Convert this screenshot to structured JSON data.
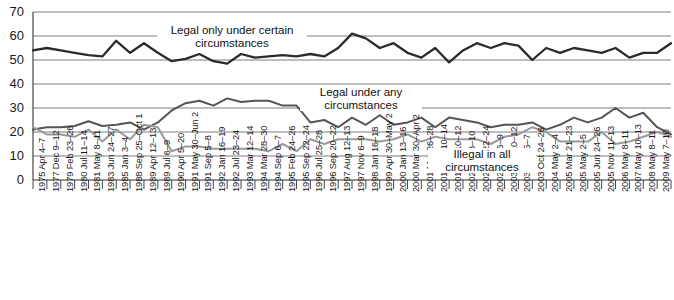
{
  "chart_data": {
    "type": "line",
    "title": "",
    "xlabel": "",
    "ylabel": "",
    "ylim": [
      0,
      70
    ],
    "ytick_step": 10,
    "grid": true,
    "legend_position": "inline-annotations",
    "yticks": [
      0,
      10,
      20,
      30,
      40,
      50,
      60,
      70
    ],
    "categories": [
      "1975 Apr 4–7",
      "1977 Dec 9–12",
      "1979 Feb 23–26",
      "1980 Jul 11–14",
      "1981 May 8–11",
      "1983 Jun 24–27",
      "1985 Jan 3–4",
      "1988 Sep 25–Oct 1",
      "1989 Apr 12–13",
      "1989 Jul 6–9",
      "1990 Apr 5–20",
      "1991 May 30–Jun 2",
      "1991 Sep 5–8",
      "1992 Jan 16–19",
      "1992 Jul 23–24",
      "1993 Mar 12–14",
      "1994 Mar 28–30",
      "1994 Sep 6–7",
      "1995 Feb 24–26",
      "1995 Sep 22–24",
      "1996 Jul 25–28",
      "1996 Sep 20–22",
      "1997 Aug 12–13",
      "1997 Nov 6–9",
      "1998 Jan 16–18",
      "1999 Apr 30–May 2",
      "2000 Jan 13–16",
      "2000 Mar 30–Apr 2",
      "2001 Mar 26–28",
      "2001 May 10–14",
      "2001 Aug 10–12",
      "2002 Feb 8–10",
      "2002 Mar 22–24",
      "2002 May 6–9",
      "2003 Jan 10–12",
      "2003 May 5–7",
      "2003 Oct 24–26",
      "2004 May 2–4",
      "2005 Mar 21–23",
      "2005 May 2–5",
      "2005 Jun 24–26",
      "2005 Nov 11–13",
      "2006 May 8–11",
      "2007 May 10–13",
      "2008 May 8–11",
      "2009 May 7–10",
      "2009 Jul 17–19"
    ],
    "series": [
      {
        "name": "Legal only under certain circumstances",
        "color": "#2b2b2b",
        "values": [
          54,
          55,
          54,
          53,
          52,
          51.5,
          58,
          53,
          57,
          53,
          49.5,
          50.5,
          52.5,
          49.5,
          48.5,
          52.5,
          51,
          51.5,
          52,
          51.5,
          52.5,
          51.5,
          55,
          61,
          59,
          55,
          57,
          53,
          51,
          55,
          49,
          54,
          57,
          55,
          57,
          56,
          50,
          55,
          53,
          55,
          54,
          53,
          55,
          51,
          53,
          53,
          57
        ]
      },
      {
        "name": "Legal under any circumstances",
        "color": "#555555",
        "values": [
          21,
          22,
          22,
          22.5,
          24.5,
          22.5,
          23,
          24,
          21,
          24,
          29,
          32,
          33,
          31,
          34,
          32.5,
          33,
          33,
          31,
          31,
          24,
          25,
          22,
          26,
          23,
          27,
          23,
          24,
          26,
          22,
          26,
          25,
          24,
          22,
          23,
          23,
          24,
          21,
          23,
          26,
          24,
          26,
          30,
          26,
          28,
          22,
          19
        ]
      },
      {
        "name": "Illegal in all circumstances",
        "color": "#9a9a9a",
        "values": [
          22,
          19,
          19,
          18,
          21,
          16,
          21,
          17,
          23,
          22,
          12,
          14,
          14,
          13,
          13,
          13,
          13,
          12,
          15,
          12,
          17,
          15,
          17,
          17,
          17,
          16,
          17,
          19,
          16,
          18,
          17,
          17,
          17,
          15,
          18,
          19,
          22,
          20,
          16,
          16,
          16,
          20,
          15,
          16,
          18,
          20,
          18
        ]
      }
    ],
    "annotations": [
      {
        "id": "annot-legal-only-under-certain",
        "line1": "Legal only under certain",
        "line2": "circumstances"
      },
      {
        "id": "annot-legal-under-any",
        "line1": "Legal under any",
        "line2": "circumstances"
      },
      {
        "id": "annot-illegal-in-all",
        "line1": "Illegal in all",
        "line2": "circumstances"
      }
    ]
  }
}
